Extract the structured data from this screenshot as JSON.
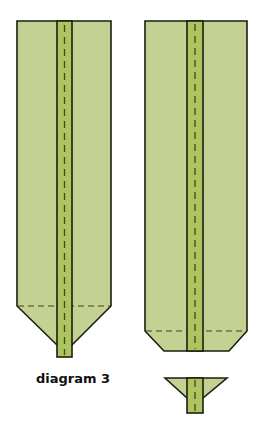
{
  "diagram": {
    "caption": "diagram 3",
    "colors": {
      "panel_fill": "#c3d293",
      "band_fill": "#adc460",
      "outline": "#1c1f12",
      "dash": "#3d4a1e"
    },
    "figures": [
      {
        "name": "pointed-strip",
        "description": "long strip folded to a point at the bottom, centre band with dashed seam, dashed fold line above the point"
      },
      {
        "name": "chamfered-strip",
        "description": "long strip with corners folded in at the bottom, centre band with dashed seam, dashed fold line"
      },
      {
        "name": "small-funnel-piece",
        "description": "small inverted-trapezoid piece with centre band and dashed seam"
      }
    ]
  }
}
